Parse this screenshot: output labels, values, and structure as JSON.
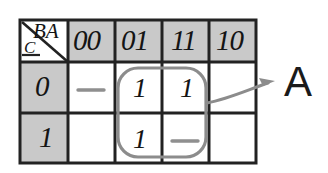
{
  "figure": {
    "type": "karnaugh-map",
    "corner": {
      "column_vars": "BA",
      "row_var": "C"
    },
    "column_headers": [
      "00",
      "01",
      "11",
      "10"
    ],
    "row_headers": [
      "0",
      "1"
    ],
    "cells": [
      [
        "—",
        "1",
        "1",
        ""
      ],
      [
        "",
        "1",
        "—",
        ""
      ]
    ],
    "group": {
      "label": "A",
      "covers_columns": [
        "01",
        "11"
      ],
      "covers_rows": [
        "0",
        "1"
      ]
    },
    "colors": {
      "header_fill": "#c9c9c9",
      "grid_line": "#222222",
      "group_outline": "#8c8c8c",
      "arrow": "#8c8c8c",
      "dash": "#8f8f8f",
      "text": "#141414"
    }
  }
}
